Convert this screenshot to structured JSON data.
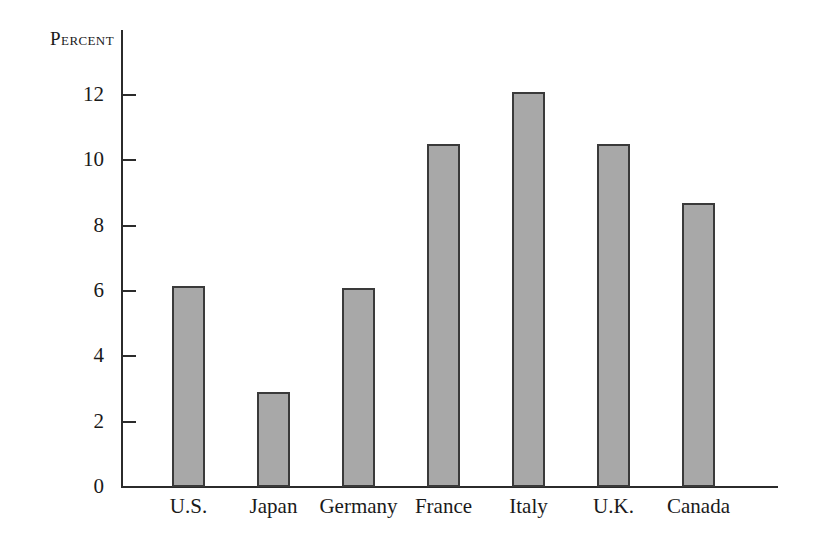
{
  "chart_data": {
    "type": "bar",
    "title": "",
    "subtitle": "",
    "xlabel": "",
    "ylabel": "Percent",
    "categories": [
      "U.S.",
      "Japan",
      "Germany",
      "France",
      "Italy",
      "U.K.",
      "Canada"
    ],
    "values": [
      6.15,
      2.9,
      6.1,
      10.5,
      12.1,
      10.5,
      8.7
    ],
    "ylim": [
      0,
      13
    ],
    "yticks": [
      0,
      2,
      4,
      6,
      8,
      10,
      12
    ],
    "ytick_labels": [
      "0",
      "2",
      "4",
      "6",
      "8",
      "10",
      "12"
    ],
    "grid": false,
    "legend": null,
    "bar_color": "#a8a8a8",
    "bar_edge_color": "#3a3a3a",
    "axis_color": "#2b2b2b",
    "background_color": "#ffffff"
  }
}
